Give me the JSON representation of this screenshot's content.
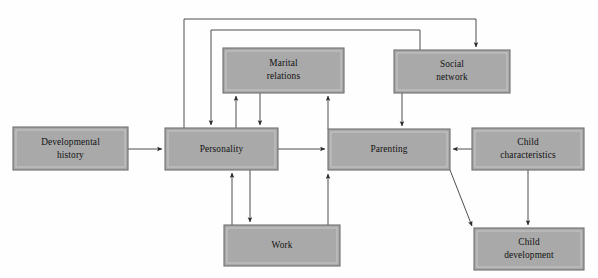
{
  "diagram": {
    "type": "flow-diagram",
    "background_color": "#fefefe",
    "node_fill_color": "#a9a9a9",
    "node_border_color": "#6e6e6e",
    "edge_color": "#3b3b3b",
    "nodes": [
      {
        "id": "developmental-history",
        "label_lines": [
          "Developmental",
          "history"
        ],
        "label": "Developmental history",
        "x": 13,
        "y": 127,
        "w": 115,
        "h": 43
      },
      {
        "id": "personality",
        "label_lines": [
          "Personality"
        ],
        "label": "Personality",
        "x": 165,
        "y": 128,
        "w": 113,
        "h": 42
      },
      {
        "id": "marital-relations",
        "label_lines": [
          "Marital",
          "relations"
        ],
        "label": "Marital relations",
        "x": 223,
        "y": 48,
        "w": 121,
        "h": 45
      },
      {
        "id": "social-network",
        "label_lines": [
          "Social",
          "network"
        ],
        "label": "Social network",
        "x": 394,
        "y": 50,
        "w": 116,
        "h": 43
      },
      {
        "id": "parenting",
        "label_lines": [
          "Parenting"
        ],
        "label": "Parenting",
        "x": 328,
        "y": 129,
        "w": 122,
        "h": 41
      },
      {
        "id": "child-characteristics",
        "label_lines": [
          "Child",
          "characteristics"
        ],
        "label": "Child characteristics",
        "x": 472,
        "y": 128,
        "w": 112,
        "h": 42
      },
      {
        "id": "work",
        "label_lines": [
          "Work"
        ],
        "label": "Work",
        "x": 224,
        "y": 225,
        "w": 116,
        "h": 41
      },
      {
        "id": "child-development",
        "label_lines": [
          "Child",
          "development"
        ],
        "label": "Child development",
        "x": 474,
        "y": 228,
        "w": 110,
        "h": 42
      }
    ],
    "edges": [
      {
        "id": "developmental-history-to-personality",
        "from": "developmental-history",
        "to": "personality",
        "arrow": "single"
      },
      {
        "id": "personality-to-parenting",
        "from": "personality",
        "to": "parenting",
        "arrow": "single"
      },
      {
        "id": "child-characteristics-to-parenting",
        "from": "child-characteristics",
        "to": "parenting",
        "arrow": "single"
      },
      {
        "id": "personality-to-marital-relations",
        "from": "personality",
        "to": "marital-relations",
        "arrow": "single"
      },
      {
        "id": "marital-relations-to-personality",
        "from": "marital-relations",
        "to": "personality",
        "arrow": "single"
      },
      {
        "id": "parenting-to-marital-relations",
        "from": "parenting",
        "to": "marital-relations",
        "arrow": "single"
      },
      {
        "id": "social-network-to-parenting",
        "from": "social-network",
        "to": "parenting",
        "arrow": "single"
      },
      {
        "id": "personality-to-social-network",
        "from": "personality",
        "to": "social-network",
        "arrow": "single",
        "routing": "top-outer-loop"
      },
      {
        "id": "social-network-to-personality",
        "from": "social-network",
        "to": "personality",
        "arrow": "single",
        "routing": "top-inner-loop"
      },
      {
        "id": "personality-to-work",
        "from": "personality",
        "to": "work",
        "arrow": "single"
      },
      {
        "id": "work-to-personality",
        "from": "work",
        "to": "personality",
        "arrow": "single"
      },
      {
        "id": "work-to-parenting",
        "from": "work",
        "to": "parenting",
        "arrow": "single"
      },
      {
        "id": "parenting-to-child-development",
        "from": "parenting",
        "to": "child-development",
        "arrow": "single"
      },
      {
        "id": "child-characteristics-to-child-development",
        "from": "child-characteristics",
        "to": "child-development",
        "arrow": "single"
      }
    ]
  }
}
